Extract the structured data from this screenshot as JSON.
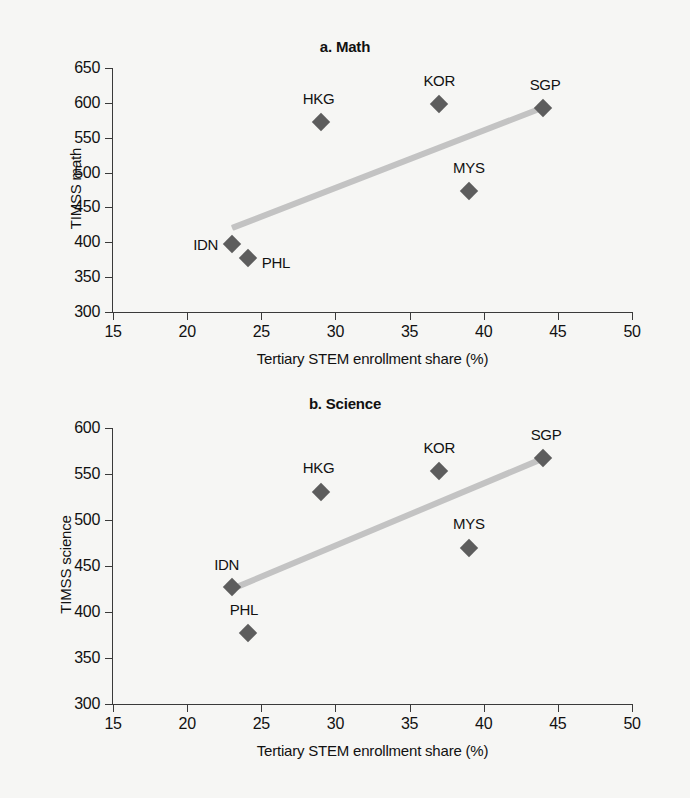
{
  "figure": {
    "background_color": "#f6f6f4",
    "marker_color": "#5d5d5d",
    "trendline_color": "#c3c3c3",
    "axis_color": "#3a3a3a"
  },
  "chart_data": [
    {
      "type": "scatter",
      "title": "a. Math",
      "xlabel": "Tertiary STEM enrollment share (%)",
      "ylabel": "TIMSS math",
      "xlim": [
        15,
        50
      ],
      "ylim": [
        300,
        650
      ],
      "xticks": [
        "15",
        "20",
        "25",
        "30",
        "35",
        "40",
        "45",
        "50"
      ],
      "yticks": [
        "650",
        "600",
        "550",
        "500",
        "450",
        "400",
        "350",
        "300"
      ],
      "grid": false,
      "legend": "none",
      "points": [
        {
          "label": "IDN",
          "x": 23.0,
          "y": 398,
          "label_dx": -26,
          "label_dy": 0
        },
        {
          "label": "PHL",
          "x": 24.1,
          "y": 378,
          "label_dx": 28,
          "label_dy": 4
        },
        {
          "label": "HKG",
          "x": 29.0,
          "y": 572,
          "label_dx": -2,
          "label_dy": -24
        },
        {
          "label": "KOR",
          "x": 37.0,
          "y": 598,
          "label_dx": 0,
          "label_dy": -24
        },
        {
          "label": "MYS",
          "x": 39.0,
          "y": 474,
          "label_dx": 0,
          "label_dy": -24
        },
        {
          "label": "SGP",
          "x": 44.0,
          "y": 593,
          "label_dx": 2,
          "label_dy": -24
        }
      ],
      "trendline": {
        "x0": 23.0,
        "y0": 420,
        "x1": 44.0,
        "y1": 593
      }
    },
    {
      "type": "scatter",
      "title": "b. Science",
      "xlabel": "Tertiary STEM enrollment share (%)",
      "ylabel": "TIMSS science",
      "xlim": [
        15,
        50
      ],
      "ylim": [
        300,
        600
      ],
      "xticks": [
        "15",
        "20",
        "25",
        "30",
        "35",
        "40",
        "45",
        "50"
      ],
      "yticks": [
        "600",
        "550",
        "500",
        "450",
        "400",
        "350",
        "300"
      ],
      "grid": false,
      "legend": "none",
      "points": [
        {
          "label": "IDN",
          "x": 23.0,
          "y": 427,
          "label_dx": -5,
          "label_dy": -23
        },
        {
          "label": "PHL",
          "x": 24.1,
          "y": 377,
          "label_dx": -4,
          "label_dy": -24
        },
        {
          "label": "HKG",
          "x": 29.0,
          "y": 530,
          "label_dx": -2,
          "label_dy": -25
        },
        {
          "label": "KOR",
          "x": 37.0,
          "y": 553,
          "label_dx": 0,
          "label_dy": -24
        },
        {
          "label": "MYS",
          "x": 39.0,
          "y": 470,
          "label_dx": 0,
          "label_dy": -25
        },
        {
          "label": "SGP",
          "x": 44.0,
          "y": 567,
          "label_dx": 3,
          "label_dy": -24
        }
      ],
      "trendline": {
        "x0": 23.0,
        "y0": 425,
        "x1": 44.0,
        "y1": 567
      }
    }
  ]
}
